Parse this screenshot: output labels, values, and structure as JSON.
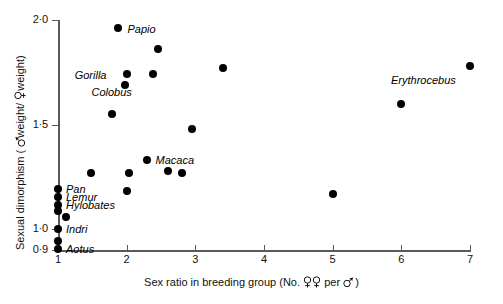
{
  "chart_data": {
    "type": "scatter",
    "title": "",
    "xlabel": "Sex ratio in breeding group (No. ♀♀ per ♂ )",
    "xlabel_parts": {
      "prefix": "Sex ratio in breeding group (No.",
      "female_symbol": "female-symbol",
      "middle": "per",
      "male_symbol": "male-symbol",
      "suffix": ")"
    },
    "ylabel": "Sexual dimorphism ( ♂weight/ ♀weight)",
    "ylabel_parts": {
      "prefix": "Sexual dimorphism (",
      "male_symbol": "male-symbol",
      "middle": "weight/",
      "female_symbol": "female-symbol",
      "suffix": "weight)"
    },
    "xlim": [
      1,
      7
    ],
    "ylim": [
      0.9,
      2.0
    ],
    "xticks": [
      1,
      2,
      3,
      4,
      5,
      6,
      7
    ],
    "xtick_labels": [
      "1",
      "2",
      "3",
      "4",
      "5",
      "6",
      "7"
    ],
    "yticks": [
      0.9,
      1.0,
      1.5,
      2.0
    ],
    "ytick_labels": [
      "0·9",
      "1·0",
      "1·5",
      "2·0"
    ],
    "grid": false,
    "legend": "none",
    "marker": "filled-circle",
    "marker_color": "#000000",
    "axis_color": "#5a5a5a",
    "points": [
      {
        "x": 1.88,
        "y": 1.96,
        "label": "Papio",
        "label_dx": 9,
        "label_dy": 3
      },
      {
        "x": 2.46,
        "y": 1.86,
        "label": "",
        "label_dx": 0,
        "label_dy": 0
      },
      {
        "x": 2.0,
        "y": 1.74,
        "label": "Gorilla",
        "label_dx": -52,
        "label_dy": 3
      },
      {
        "x": 1.98,
        "y": 1.69,
        "label": "",
        "label_dx": 0,
        "label_dy": 0
      },
      {
        "x": 2.39,
        "y": 1.74,
        "label": "Colobus",
        "label_dx": -62,
        "label_dy": 20
      },
      {
        "x": 7.0,
        "y": 1.78,
        "label": "Erythrocebus",
        "label_dx": -79,
        "label_dy": 16
      },
      {
        "x": 6.0,
        "y": 1.6,
        "label": "",
        "label_dx": 0,
        "label_dy": 0
      },
      {
        "x": 3.4,
        "y": 1.77,
        "label": "",
        "label_dx": 0,
        "label_dy": 0
      },
      {
        "x": 1.78,
        "y": 1.55,
        "label": "",
        "label_dx": 0,
        "label_dy": 0
      },
      {
        "x": 2.95,
        "y": 1.48,
        "label": "",
        "label_dx": 0,
        "label_dy": 0
      },
      {
        "x": 2.29,
        "y": 1.33,
        "label": "Macaca",
        "label_dx": 9,
        "label_dy": 2
      },
      {
        "x": 2.6,
        "y": 1.28,
        "label": "",
        "label_dx": 0,
        "label_dy": 0
      },
      {
        "x": 2.8,
        "y": 1.27,
        "label": "",
        "label_dx": 0,
        "label_dy": 0
      },
      {
        "x": 1.48,
        "y": 1.27,
        "label": "",
        "label_dx": 0,
        "label_dy": 0
      },
      {
        "x": 2.03,
        "y": 1.27,
        "label": "",
        "label_dx": 0,
        "label_dy": 0
      },
      {
        "x": 2.0,
        "y": 1.18,
        "label": "",
        "label_dx": 0,
        "label_dy": 0
      },
      {
        "x": 5.0,
        "y": 1.17,
        "label": "",
        "label_dx": 0,
        "label_dy": 0
      },
      {
        "x": 1.0,
        "y": 1.19,
        "label": "Pan",
        "label_dx": 8,
        "label_dy": 2
      },
      {
        "x": 1.0,
        "y": 1.155,
        "label": "Lemur",
        "label_dx": 8,
        "label_dy": 2
      },
      {
        "x": 1.0,
        "y": 1.115,
        "label": "Hylobates",
        "label_dx": 8,
        "label_dy": 2
      },
      {
        "x": 1.0,
        "y": 1.085,
        "label": "",
        "label_dx": 0,
        "label_dy": 0
      },
      {
        "x": 1.12,
        "y": 1.06,
        "label": "",
        "label_dx": 0,
        "label_dy": 0
      },
      {
        "x": 1.0,
        "y": 1.0,
        "label": "Indri",
        "label_dx": 8,
        "label_dy": 2
      },
      {
        "x": 1.0,
        "y": 0.945,
        "label": "",
        "label_dx": 0,
        "label_dy": 0
      },
      {
        "x": 1.0,
        "y": 0.905,
        "label": "Aotus",
        "label_dx": 8,
        "label_dy": 2
      }
    ]
  }
}
